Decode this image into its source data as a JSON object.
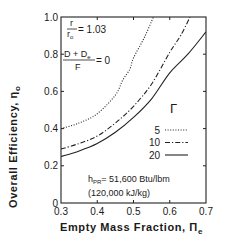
{
  "chart_data": {
    "type": "line",
    "title": "",
    "xlabel": "Empty Mass Fraction, Π_e",
    "ylabel": "Overall Efficiency, η_o",
    "xlim": [
      0.3,
      0.7
    ],
    "ylim": [
      0,
      1.0
    ],
    "x_ticks": [
      0.3,
      0.4,
      0.5,
      0.6,
      0.7
    ],
    "x_tick_labels": [
      "0.3",
      "0.4",
      "0.5",
      "0.6",
      "0.7"
    ],
    "y_ticks": [
      0,
      0.2,
      0.4,
      0.6,
      0.8,
      1.0
    ],
    "y_tick_labels": [
      "0",
      "0.2",
      "0.4",
      "0.6",
      "0.8",
      "1.0"
    ],
    "grid": false,
    "legend_title": "Γ",
    "legend_position": "lower right",
    "series": [
      {
        "name": "5",
        "style": "dotted",
        "x": [
          0.3,
          0.35,
          0.4,
          0.45,
          0.47,
          0.49,
          0.5,
          0.53,
          0.555
        ],
        "y": [
          0.4,
          0.43,
          0.48,
          0.58,
          0.66,
          0.72,
          0.78,
          0.89,
          1.0
        ]
      },
      {
        "name": "10",
        "style": "dash-dot",
        "x": [
          0.3,
          0.35,
          0.4,
          0.45,
          0.5,
          0.55,
          0.6,
          0.63,
          0.656
        ],
        "y": [
          0.29,
          0.32,
          0.36,
          0.43,
          0.52,
          0.64,
          0.81,
          0.9,
          1.0
        ]
      },
      {
        "name": "20",
        "style": "solid",
        "x": [
          0.3,
          0.35,
          0.4,
          0.45,
          0.5,
          0.55,
          0.6,
          0.65,
          0.7
        ],
        "y": [
          0.25,
          0.28,
          0.32,
          0.38,
          0.46,
          0.56,
          0.7,
          0.8,
          0.92
        ]
      }
    ],
    "annotations": [
      {
        "text": "r / r_o = 1.03"
      },
      {
        "text": "(D + D_e) / F = 0"
      },
      {
        "text": "h_PR = 51,600 Btu/lbm"
      },
      {
        "text": "(120,000 kJ/kg)"
      }
    ]
  },
  "labels": {
    "ylabel_main": "Overall Efficiency, η",
    "ylabel_sub": "o",
    "xlabel_main": "Empty Mass Fraction, Π",
    "xlabel_sub": "e",
    "ratio_num": "r",
    "ratio_den": "r",
    "ratio_den_sub": "o",
    "ratio_value": "= 1.03",
    "drag_num": "D + D",
    "drag_num_sub": "e",
    "drag_den": "F",
    "drag_value": "= 0",
    "legend_title": "Γ",
    "hpr_main": "h",
    "hpr_sub": "PR",
    "hpr_value": "= 51,600 Btu/lbm",
    "hpr_si": "(120,000 kJ/kg)"
  }
}
